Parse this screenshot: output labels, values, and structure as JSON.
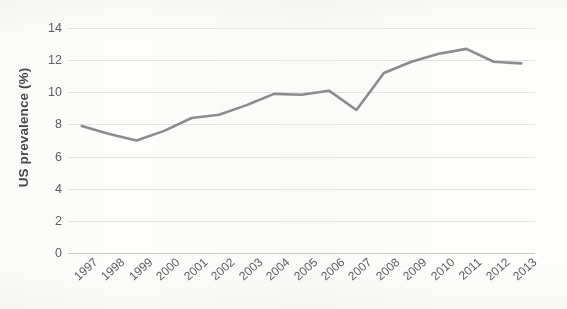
{
  "chart_data": {
    "type": "line",
    "title": "",
    "xlabel": "",
    "ylabel": "US prevalence (%)",
    "categories": [
      "1997",
      "1998",
      "1999",
      "2000",
      "2001",
      "2002",
      "2003",
      "2004",
      "2005",
      "2006",
      "2007",
      "2008",
      "2009",
      "2010",
      "2011",
      "2012",
      "2013"
    ],
    "values": [
      7.9,
      7.4,
      7.0,
      7.6,
      8.4,
      8.6,
      9.2,
      9.9,
      9.85,
      10.1,
      8.9,
      11.2,
      11.9,
      12.4,
      12.7,
      11.9,
      11.8
    ],
    "series": [
      {
        "name": "US prevalence",
        "values": [
          7.9,
          7.4,
          7.0,
          7.6,
          8.4,
          8.6,
          9.2,
          9.9,
          9.85,
          10.1,
          8.9,
          11.2,
          11.9,
          12.4,
          12.7,
          11.9,
          11.8
        ]
      }
    ],
    "ylim": [
      0,
      14
    ],
    "yticks": [
      0,
      2,
      4,
      6,
      8,
      10,
      12,
      14
    ],
    "ytick_labels": [
      "0",
      "2",
      "4",
      "6",
      "8",
      "10",
      "12",
      "14"
    ],
    "grid": true,
    "grid_axis": "y",
    "legend": false,
    "legend_position": "none",
    "line_color": "#8c8c8c",
    "line_width": 2.6,
    "markers": false,
    "gridline_color": "#e3e3e1",
    "axis_color": "#c9c9c6",
    "tick_label_color": "#5c5c5c",
    "axis_title_color": "#4a4a4a",
    "background_color": "#fdfdfc",
    "xtick_rotation": -42
  }
}
